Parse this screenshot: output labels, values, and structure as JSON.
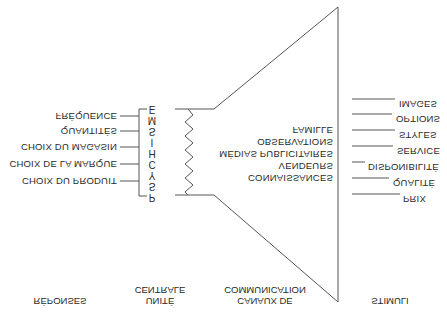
{
  "diagram": {
    "headers": {
      "stimuli": "STIMULI",
      "channels_line1": "CANAUX DE",
      "channels_line2": "COMMUNICATION",
      "central_line1": "UNITÉ",
      "central_line2": "CENTRALE",
      "responses": "RÉPONSES"
    },
    "stimuli": [
      "IMAGES",
      "OPTIONS",
      "STYLES",
      "SERVICE",
      "DISPONIBILITÉ",
      "QUALITÉ",
      "PRIX"
    ],
    "channels": [
      "FAMILLE",
      "OBSERVATIONS",
      "MÉDIAS PUBLICITAIRES",
      "VENDEURS",
      "CONNAISSANCES"
    ],
    "central_unit_letters": [
      "E",
      "M",
      "S",
      "I",
      "H",
      "C",
      "Y",
      "S",
      "P"
    ],
    "responses": [
      "FRÉQUENCE",
      "QUANTITÉS",
      "CHOIX DU MAGASIN",
      "CHOIX DE LA MARQUE",
      "CHOIX DU PRODUIT"
    ],
    "orientation": "flipped-vertical",
    "line_color": "#555555"
  }
}
